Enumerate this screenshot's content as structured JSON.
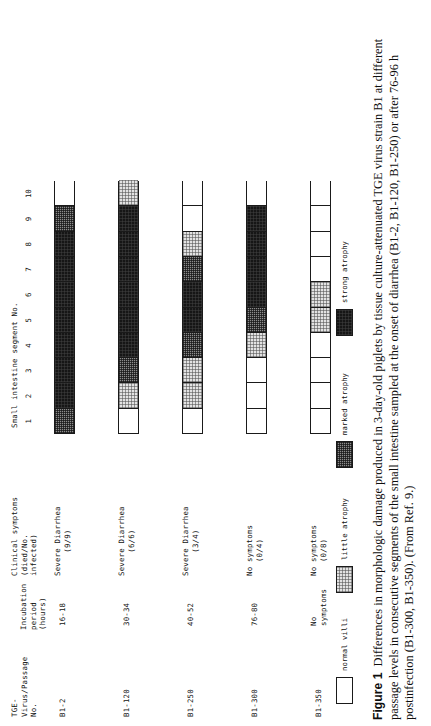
{
  "figure": {
    "number_label": "Figure 1",
    "caption": "Differences in morphologic damage produced in 3-day-old piglets by tissue culture-attenuated TGE virus strain B1 at different passage levels in consecutive segments of the small intestine sampled at the onset of diarrhea (B1-2, B1-120, B1-250) or after 76-96 h postinfection (B1-300, B1-350). (From Ref. 9.)"
  },
  "headers": {
    "strain": "TGE-\nVirus/Passage\nNo.",
    "incubation": "Incubation\nperiod\n(hours)",
    "clinical": "Clinical symptoms\n(died/No.\ninfected)",
    "segment_axis": "Small intestine segment No."
  },
  "segment_numbers": [
    "1",
    "2",
    "3",
    "4",
    "5",
    "6",
    "7",
    "8",
    "9",
    "10"
  ],
  "legend": {
    "items": [
      {
        "label": "normal villi",
        "severity": "normal"
      },
      {
        "label": "little atrophy",
        "severity": "little"
      },
      {
        "label": "marked atrophy",
        "severity": "marked"
      },
      {
        "label": "strong atrophy",
        "severity": "strong"
      }
    ]
  },
  "chart_data": {
    "type": "heatmap",
    "title": "Differences in morphologic damage produced in 3-day-old piglets by tissue culture-attenuated TGE virus strain B1",
    "xlabel": "Small intestine segment No.",
    "ylabel": "TGE-Virus/Passage No.",
    "categories": [
      "1",
      "2",
      "3",
      "4",
      "5",
      "6",
      "7",
      "8",
      "9",
      "10"
    ],
    "severity_scale": [
      "normal",
      "little",
      "marked",
      "strong"
    ],
    "legend_position": "bottom",
    "grid": true,
    "rows": [
      {
        "strain": "B1-2",
        "incubation": "16-18",
        "clinical_line1": "Severe Diarrhea",
        "clinical_line2": "(9/9)",
        "segments": [
          "marked",
          "strong",
          "strong",
          "strong",
          "strong",
          "strong",
          "strong",
          "strong",
          "marked",
          "normal"
        ]
      },
      {
        "strain": "B1-120",
        "incubation": "30-34",
        "clinical_line1": "Severe Diarrhea",
        "clinical_line2": "(6/6)",
        "segments": [
          "normal",
          "little",
          "marked",
          "strong",
          "strong",
          "strong",
          "strong",
          "strong",
          "strong",
          "little"
        ]
      },
      {
        "strain": "B1-250",
        "incubation": "40-52",
        "clinical_line1": "Severe Diarrhea",
        "clinical_line2": "(3/4)",
        "segments": [
          "normal",
          "little",
          "little",
          "marked",
          "strong",
          "strong",
          "marked",
          "little",
          "normal",
          "normal"
        ]
      },
      {
        "strain": "B1-300",
        "incubation": "76-80",
        "clinical_line1": "No symptoms",
        "clinical_line2": "(0/4)",
        "segments": [
          "normal",
          "normal",
          "normal",
          "little",
          "marked",
          "strong",
          "strong",
          "strong",
          "strong",
          "normal"
        ]
      },
      {
        "strain": "B1-350",
        "incubation": "No\nsymptoms",
        "clinical_line1": "No symptoms",
        "clinical_line2": "(0/8)",
        "segments": [
          "normal",
          "normal",
          "normal",
          "normal",
          "little",
          "little",
          "normal",
          "normal",
          "normal",
          "normal"
        ]
      }
    ]
  }
}
